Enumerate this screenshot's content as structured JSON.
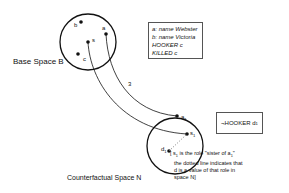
{
  "base_space": {
    "label": "Base Space B",
    "points": [
      {
        "id": "b",
        "label": "b"
      },
      {
        "id": "a",
        "label": "a"
      },
      {
        "id": "s",
        "label": "s"
      },
      {
        "id": "c",
        "label": "c"
      }
    ]
  },
  "counterfactual_space": {
    "label": "Counterfactual Space N",
    "points": [
      {
        "id": "a1",
        "label": "a",
        "sub": "1"
      },
      {
        "id": "s1",
        "label": "s",
        "sub": "1"
      },
      {
        "id": "d1",
        "label": "d",
        "sub": "1"
      }
    ]
  },
  "connector_label": "3",
  "base_box": {
    "lines": [
      "a: name Webster",
      "b: name Victoria",
      "HOOKER c",
      "KILLED c"
    ]
  },
  "counterfactual_box": {
    "prefix": "¬HOOKER d",
    "sub": "1"
  },
  "note": {
    "line1_pre": "[ s",
    "line1_sub": "1",
    "line1_mid": " is the role \"sister of a",
    "line1_sub2": "1",
    "line1_post": "\"",
    "line2": "the dotted line indicates that",
    "line3": "d  is a value of that role in",
    "line4": "space N]"
  }
}
